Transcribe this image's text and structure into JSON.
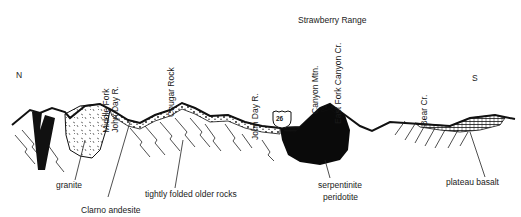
{
  "title": "Strawberry Range",
  "directions": {
    "north": "N",
    "south": "S"
  },
  "highway_shield": "26",
  "place_labels": [
    {
      "id": "middle-fork",
      "lines": [
        "Middle Fork",
        "John Day R."
      ]
    },
    {
      "id": "cougar-rock",
      "lines": [
        "Cougar Rock"
      ]
    },
    {
      "id": "john-day-r",
      "lines": [
        "John Day R."
      ]
    },
    {
      "id": "canyon-mtn",
      "lines": [
        "Canyon Mtn."
      ]
    },
    {
      "id": "east-fork",
      "lines": [
        "East Fork Canyon Cr."
      ]
    },
    {
      "id": "bear-cr",
      "lines": [
        "Bear Cr."
      ]
    }
  ],
  "rock_labels": {
    "granite": "granite",
    "clarno": "Clarno andesite",
    "folded": "tightly folded older rocks",
    "serpentinite": "serpentinite",
    "peridotite": "peridotite",
    "basalt": "plateau basalt"
  }
}
